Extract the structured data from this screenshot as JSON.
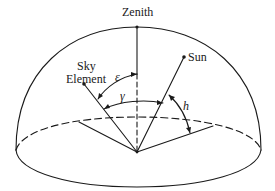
{
  "figure": {
    "type": "sky-hemisphere-geometry",
    "labels": {
      "zenith": "Zenith",
      "sun": "Sun",
      "sky_element_line1": "Sky",
      "sky_element_line2": "Element",
      "epsilon": "ε",
      "gamma": "γ",
      "h": "h"
    },
    "angles": [
      {
        "symbol": "ε",
        "between": [
          "zenith",
          "sky element"
        ]
      },
      {
        "symbol": "γ",
        "between": [
          "sky element",
          "sun"
        ]
      },
      {
        "symbol": "h",
        "between": [
          "horizon",
          "sun"
        ]
      }
    ],
    "colors": {
      "stroke": "#1a1a1a",
      "background": "#ffffff"
    }
  }
}
